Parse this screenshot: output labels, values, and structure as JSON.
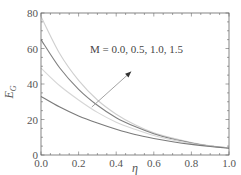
{
  "chart_data": {
    "type": "line",
    "title": "",
    "xlabel": "η",
    "ylabel": "E_G",
    "xlim": [
      0,
      1
    ],
    "ylim": [
      0,
      80
    ],
    "xticks": [
      "0.0",
      "0.2",
      "0.4",
      "0.6",
      "0.8",
      "1.0"
    ],
    "yticks": [
      "0",
      "20",
      "40",
      "60",
      "80"
    ],
    "grid": false,
    "legend": null,
    "annotation": {
      "text": "M = 0.0, 0.5, 1.0, 1.5",
      "arrow": {
        "from": [
          0.27,
          27
        ],
        "to": [
          0.48,
          47
        ]
      }
    },
    "x": [
      0.0,
      0.1,
      0.2,
      0.3,
      0.4,
      0.5,
      0.6,
      0.7,
      0.8,
      0.9,
      1.0
    ],
    "series": [
      {
        "name": "M = 0.0",
        "color": "#cfcfcf",
        "values": [
          78,
          57,
          42,
          31,
          23,
          17,
          12.5,
          9.5,
          7,
          5.2,
          4
        ]
      },
      {
        "name": "M = 0.5",
        "color": "#808080",
        "values": [
          65,
          49,
          37,
          28,
          21,
          16,
          12,
          9,
          6.8,
          5.1,
          4
        ]
      },
      {
        "name": "M = 1.0",
        "color": "#d6d6d6",
        "values": [
          49,
          39,
          31,
          24,
          18.5,
          14.5,
          11,
          8.5,
          6.5,
          5,
          4
        ]
      },
      {
        "name": "M = 1.5",
        "color": "#7a7a7a",
        "values": [
          33,
          27,
          22,
          18,
          14.5,
          11.5,
          9.3,
          7.5,
          6,
          4.8,
          3.8
        ]
      }
    ]
  },
  "labels": {
    "xlabel": "η",
    "ylabel_main": "E",
    "ylabel_sub": "G",
    "annotation": "M = 0.0, 0.5, 1.0, 1.5",
    "xticks": [
      "0.0",
      "0.2",
      "0.4",
      "0.6",
      "0.8",
      "1.0"
    ],
    "yticks": [
      "0",
      "20",
      "40",
      "60",
      "80"
    ]
  }
}
